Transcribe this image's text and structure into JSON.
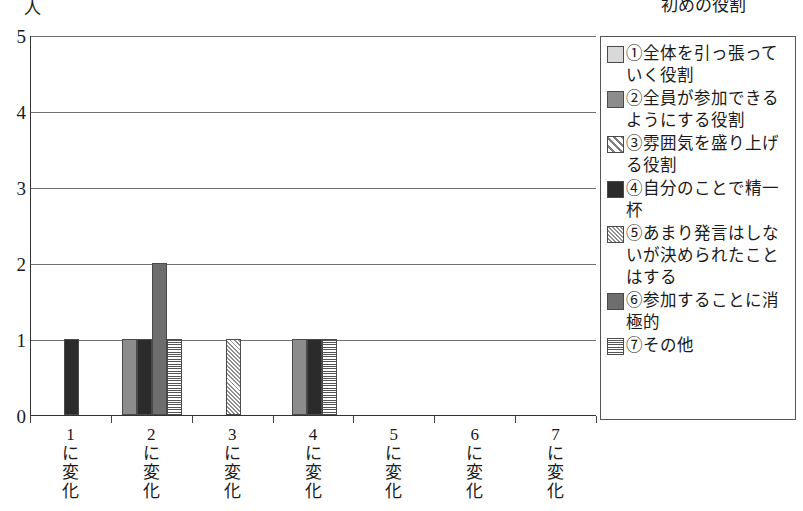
{
  "axis": {
    "y_unit": "人",
    "y_ticks": [
      "0",
      "1",
      "2",
      "3",
      "4",
      "5"
    ],
    "x_labels": [
      "1\nに\n変\n化",
      "2\nに\n変\n化",
      "3\nに\n変\n化",
      "4\nに\n変\n化",
      "5\nに\n変\n化",
      "6\nに\n変\n化",
      "7\nに\n変\n化"
    ]
  },
  "legend": {
    "title": "初めの役割",
    "items": [
      {
        "key": "1",
        "label": "①全体を引っ張っていく役割",
        "swatch": "light-gray-fill"
      },
      {
        "key": "2",
        "label": "②全員が参加できるようにする役割",
        "swatch": "medium-gray-fill"
      },
      {
        "key": "3",
        "label": "③雰囲気を盛り上げる役割",
        "swatch": "wide-diagonal-hatch"
      },
      {
        "key": "4",
        "label": "④自分のことで精一杯",
        "swatch": "black-fill"
      },
      {
        "key": "5",
        "label": "⑤あまり発言はしないが決められたことはする",
        "swatch": "fine-diagonal-hatch"
      },
      {
        "key": "6",
        "label": "⑥参加することに消極的",
        "swatch": "dark-gray-fill"
      },
      {
        "key": "7",
        "label": "⑦その他",
        "swatch": "cross-hatch"
      }
    ]
  },
  "chart_data": {
    "type": "bar",
    "title": "",
    "xlabel": "",
    "ylabel": "人",
    "ylim": [
      0,
      5
    ],
    "grid": true,
    "legend_position": "right",
    "legend_title": "初めの役割",
    "categories": [
      "1に変化",
      "2に変化",
      "3に変化",
      "4に変化",
      "5に変化",
      "6に変化",
      "7に変化"
    ],
    "series": [
      {
        "name": "①全体を引っ張っていく役割",
        "values": [
          0,
          1,
          0,
          1,
          0,
          0,
          0
        ]
      },
      {
        "name": "②全員が参加できるようにする役割",
        "values": [
          0,
          0,
          0,
          0,
          0,
          0,
          0
        ]
      },
      {
        "name": "③雰囲気を盛り上げる役割",
        "values": [
          1,
          1,
          0,
          1,
          0,
          0,
          0
        ]
      },
      {
        "name": "④自分のことで精一杯",
        "values": [
          0,
          0,
          1,
          0,
          0,
          0,
          0
        ]
      },
      {
        "name": "⑤あまり発言はしないが決められたことはする",
        "values": [
          0,
          2,
          0,
          0,
          0,
          0,
          0
        ]
      },
      {
        "name": "⑥参加することに消極的",
        "values": [
          0,
          1,
          0,
          1,
          0,
          0,
          0
        ]
      },
      {
        "name": "⑦その他",
        "values": [
          0,
          0,
          0,
          0,
          0,
          0,
          0
        ]
      }
    ],
    "bars": [
      {
        "group": 0,
        "series": 3,
        "value": 1
      },
      {
        "group": 1,
        "series": 1,
        "value": 1
      },
      {
        "group": 1,
        "series": 3,
        "value": 1
      },
      {
        "group": 1,
        "series": 5,
        "value": 2
      },
      {
        "group": 1,
        "series": 6,
        "value": 1
      },
      {
        "group": 2,
        "series": 4,
        "value": 1
      },
      {
        "group": 3,
        "series": 1,
        "value": 1
      },
      {
        "group": 3,
        "series": 6,
        "value": 1
      },
      {
        "group": 3,
        "series": 3,
        "value": 1
      }
    ]
  }
}
